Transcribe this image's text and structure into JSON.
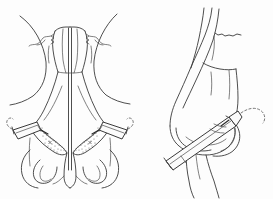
{
  "figure": {
    "title": "Nasal tip injection technique",
    "caption": "",
    "background_color": "#fdfdfd",
    "line_color": "#3a3a3a",
    "panels": [
      {
        "id": "panel-frontal",
        "label": "",
        "view": "frontal (anteroposterior) view of nose",
        "parts": [
          "nasal root / radix",
          "nasal dorsum",
          "nasal bones",
          "upper lateral cartilages",
          "lower lateral (alar) cartilages",
          "nasal tip",
          "columella",
          "nostrils (nares)",
          "alar base",
          "cheek contour"
        ],
        "instruments": [
          {
            "name": "syringe-left",
            "type": "syringe with needle",
            "side": "patient right (image left)",
            "target": "lower lateral cartilage / alar region"
          },
          {
            "name": "syringe-right",
            "type": "syringe with needle",
            "side": "patient left (image right)",
            "target": "lower lateral cartilage / alar region"
          }
        ],
        "shaded_regions": [
          {
            "name": "injection-zone-left",
            "pattern": "stippled",
            "meaning": "infiltration field in alar cartilage"
          },
          {
            "name": "injection-zone-right",
            "pattern": "stippled",
            "meaning": "infiltration field in alar cartilage"
          }
        ]
      },
      {
        "id": "panel-lateral",
        "label": "",
        "view": "lateral (profile) view of nose",
        "parts": [
          "forehead / glabella",
          "nasal root / radix",
          "nasal dorsum",
          "nasal bone",
          "upper lateral cartilage",
          "lower lateral (alar) cartilage",
          "nasal tip",
          "alar rim",
          "columella",
          "upper lip"
        ],
        "instruments": [
          {
            "name": "syringe-lateral",
            "type": "syringe with needle and plunger",
            "side": "profile",
            "target": "nasal tip / lower lateral cartilage"
          }
        ],
        "shaded_regions": []
      }
    ]
  }
}
